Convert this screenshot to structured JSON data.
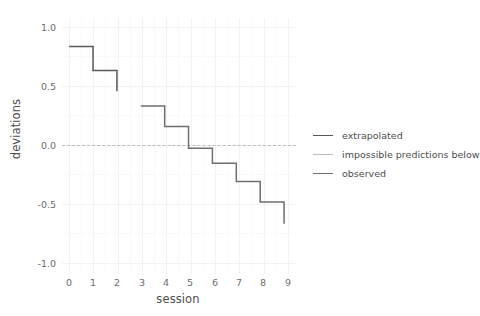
{
  "chart_data": {
    "type": "line",
    "subtype": "step",
    "title": "",
    "xlabel": "session",
    "ylabel": "deviations",
    "xlim": [
      -0.3,
      9.5
    ],
    "ylim": [
      -1.12,
      1.12
    ],
    "xticks": [
      "0",
      "1",
      "2",
      "3",
      "4",
      "5",
      "6",
      "7",
      "8",
      "9"
    ],
    "yticks": [
      "1.0",
      "0.5",
      "0.0",
      "-0.5",
      "-1.0"
    ],
    "xtick_values": [
      0,
      1,
      2,
      3,
      4,
      5,
      6,
      7,
      8,
      9
    ],
    "ytick_values": [
      1.0,
      0.5,
      0.0,
      -0.5,
      -1.0
    ],
    "grid": true,
    "legend_position": "right",
    "series": [
      {
        "name": "extrapolated",
        "color": "#595959",
        "linetype": "solid",
        "step_x": [
          0,
          1,
          2
        ],
        "step_y": [
          0.87,
          0.66,
          0.48
        ],
        "note": "first step block, ends with drop at session 2"
      },
      {
        "name": "observed",
        "color": "#6e6e6e",
        "linetype": "solid",
        "step_x": [
          3,
          4,
          5,
          6,
          7,
          8,
          9
        ],
        "step_y": [
          0.35,
          0.17,
          -0.02,
          -0.15,
          -0.31,
          -0.49,
          -0.68
        ],
        "note": "second step block from session 3 to 9"
      },
      {
        "name": "impossible predictions below",
        "color": "#bdbdbd",
        "linetype": "dashed",
        "y_intercept": 0.0
      }
    ],
    "annotations": [
      {
        "name": "zero-reference-line",
        "y": 0.0,
        "style": "dashed",
        "color": "#bdbdbd"
      }
    ]
  },
  "legend": {
    "items": [
      {
        "label": "extrapolated",
        "color": "#595959"
      },
      {
        "label": "impossible predictions below",
        "color": "#bdbdbd"
      },
      {
        "label": "observed",
        "color": "#6e6e6e"
      }
    ]
  },
  "axes": {
    "x_title": "session",
    "y_title": "deviations"
  }
}
